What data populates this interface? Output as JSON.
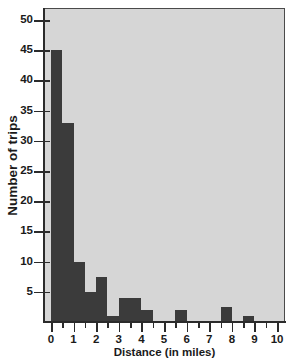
{
  "chart_data": {
    "type": "bar",
    "title": "",
    "subtitle": "",
    "xlabel": "Distance (in miles)",
    "ylabel": "Number of trips",
    "xlim": [
      -0.35,
      10.35
    ],
    "ylim": [
      0,
      52
    ],
    "bin_width": 0.5,
    "grid": false,
    "legend": null,
    "x_major_ticks": [
      "0",
      "1",
      "2",
      "3",
      "4",
      "5",
      "6",
      "7",
      "8",
      "9",
      "10"
    ],
    "x_minor_ticks": [
      "0.5",
      "1.5",
      "2.5",
      "3.5",
      "4.5",
      "5.5",
      "6.5",
      "7.5",
      "8.5",
      "9.5"
    ],
    "y_ticks": [
      "5",
      "10",
      "15",
      "20",
      "25",
      "30",
      "35",
      "40",
      "45",
      "50"
    ],
    "bin_labels": [
      "0.0-0.5",
      "0.5-1.0",
      "1.0-1.5",
      "1.5-2.0",
      "2.0-2.5",
      "2.5-3.0",
      "3.0-3.5",
      "3.5-4.0",
      "4.0-4.5",
      "4.5-5.0",
      "5.0-5.5",
      "5.5-6.0",
      "6.0-6.5",
      "6.5-7.0",
      "7.0-7.5",
      "7.5-8.0",
      "8.0-8.5",
      "8.5-9.0",
      "9.0-9.5",
      "9.5-10.0"
    ],
    "bin_starts": [
      0,
      0.5,
      1,
      1.5,
      2,
      2.5,
      3,
      3.5,
      4,
      4.5,
      5,
      5.5,
      6,
      6.5,
      7,
      7.5,
      8,
      8.5,
      9,
      9.5
    ],
    "values": [
      45,
      33,
      10,
      5,
      7.5,
      1,
      4,
      4,
      2,
      0,
      0,
      2,
      0,
      0,
      0,
      2.5,
      0,
      1,
      0,
      0
    ],
    "colors": {
      "bar": "#3b3b3b",
      "plot_background": "#d6d6d6",
      "page_background": "#ffffff",
      "axis": "#2b2b2b",
      "text": "#1a1a1a"
    }
  }
}
